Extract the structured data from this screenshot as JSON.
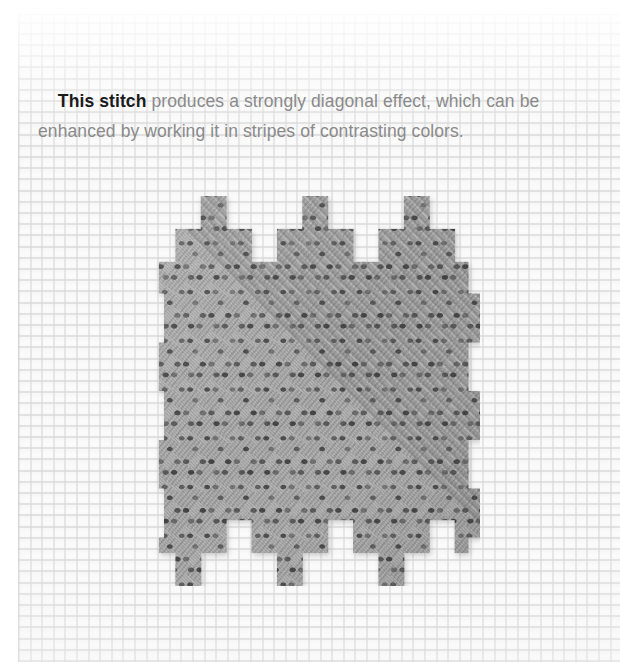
{
  "page": {
    "width": 620,
    "height": 662,
    "background_color": "#ffffff"
  },
  "fabric": {
    "name": "needlepoint-canvas",
    "base_color": "#fbfbfb",
    "thread_color": "#d6d6d6",
    "grid_pitch_px": 11.5,
    "left": 18,
    "top": 14
  },
  "caption": {
    "lead": "This stitch",
    "rest": " produces a strongly diagonal effect, which can be enhanced by working it in stripes of contrasting colors.",
    "full_text": "This stitch produces a strongly diagonal effect, which can be enhanced by working it in stripes of contrasting colors.",
    "lead_color": "#1b1b1b",
    "body_color": "#8a8a8a",
    "font_size_px": 17.5,
    "line_height_px": 30
  },
  "stitch_sample": {
    "name": "diagonal-stitch-swatch",
    "yarn_color": "#9a9a9a",
    "yarn_shadow_color": "#6f6f6f",
    "yarn_highlight_color": "#c2c2c2",
    "dot_color": "#3a3a3a",
    "left": 150,
    "top": 196,
    "width": 330,
    "height": 390,
    "stitch_direction_degrees": 45,
    "block_size_px": 26,
    "step_offset_px": 13,
    "columns": 13,
    "rows": 16,
    "silhouette": "stepped-diagonal-staircase"
  }
}
